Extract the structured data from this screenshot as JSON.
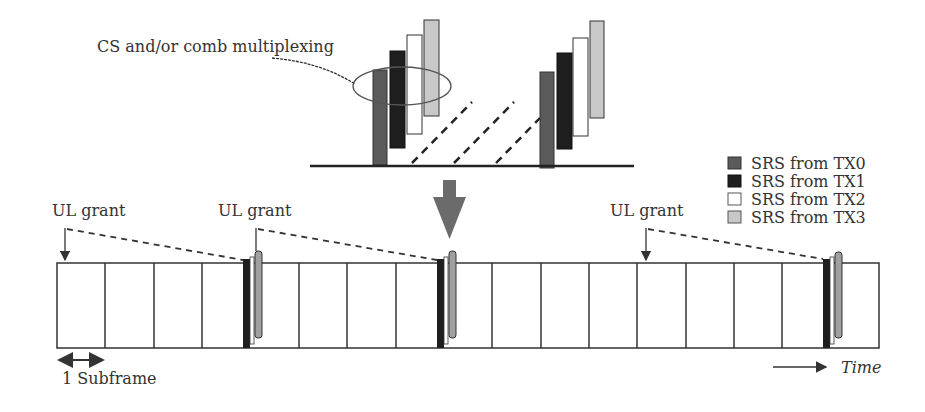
{
  "diagram": {
    "top_inset": {
      "annotation": "CS and/or comb multiplexing",
      "description": "Zoomed SRS symbols from four TX antennas multiplexed by cyclic shift and/or comb"
    },
    "legend": {
      "items": [
        {
          "label": "SRS from TX0",
          "color": "#5a5a5a"
        },
        {
          "label": "SRS from TX1",
          "color": "#1e1e1e"
        },
        {
          "label": "SRS from TX2",
          "color": "#ffffff"
        },
        {
          "label": "SRS from TX3",
          "color": "#c8c8c8"
        }
      ]
    },
    "timeline": {
      "subframe_count": 17,
      "srs_subframe_indices": [
        4,
        8,
        16
      ],
      "grants": [
        {
          "label": "UL grant",
          "subframe_index": 0
        },
        {
          "label": "UL grant",
          "subframe_index": 4
        },
        {
          "label": "UL grant",
          "subframe_index": 12
        }
      ],
      "subframe_label": "1 Subframe",
      "time_label": "Time"
    },
    "colors": {
      "line": "#333333",
      "tx0": "#5a5a5a",
      "tx1": "#1e1e1e",
      "tx2": "#ffffff",
      "tx3": "#c8c8c8",
      "down_arrow": "#6b6b6b"
    }
  }
}
